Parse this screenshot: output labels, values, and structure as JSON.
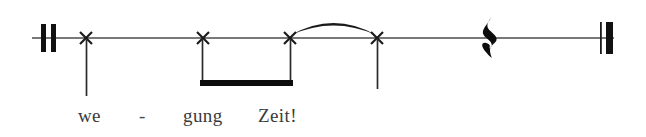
{
  "figure": {
    "width": 646,
    "height": 137,
    "background_color": "#ffffff",
    "ink_color": "#1a1a1a",
    "staff_line_color": "#4d4d4d",
    "lyric_color": "#3a3a3c"
  },
  "staff": {
    "line_y": 38,
    "line_start_x": 32,
    "line_end_x": 614,
    "line_thickness": 1.6
  },
  "barlines": [
    {
      "name": "opening-double-barline",
      "type": "thick-thick",
      "x": 40,
      "top_y": 24,
      "bottom_y": 52,
      "strokes": [
        {
          "x": 41,
          "width": 5
        },
        {
          "x": 51,
          "width": 5
        }
      ]
    },
    {
      "name": "final-barline",
      "type": "thin-thick",
      "x": 600,
      "top_y": 22,
      "bottom_y": 54,
      "strokes": [
        {
          "x": 600,
          "width": 1.6
        },
        {
          "x": 606,
          "width": 7
        }
      ]
    }
  ],
  "notes": [
    {
      "index": 1,
      "notehead": "x-notehead",
      "x": 86,
      "y": 38,
      "size": 11,
      "stem": {
        "direction": "down",
        "from_y": 40,
        "to_y": 96
      },
      "lyric": "we",
      "beamed": false,
      "slurred": false
    },
    {
      "index": 2,
      "notehead": "x-notehead",
      "x": 203,
      "y": 38,
      "size": 11,
      "stem": {
        "direction": "down",
        "from_y": 40,
        "to_y": 84
      },
      "lyric": "gung",
      "beamed": true,
      "slurred": false
    },
    {
      "index": 3,
      "notehead": "x-notehead",
      "x": 290,
      "y": 38,
      "size": 11,
      "stem": {
        "direction": "down",
        "from_y": 40,
        "to_y": 84
      },
      "lyric": "Zeit!",
      "beamed": true,
      "slurred": true
    },
    {
      "index": 4,
      "notehead": "x-notehead",
      "x": 377,
      "y": 38,
      "size": 11,
      "stem": {
        "direction": "down",
        "from_y": 40,
        "to_y": 89
      },
      "lyric": "",
      "beamed": false,
      "slurred": true
    }
  ],
  "beam": {
    "name": "eighth-beam",
    "from_x": 200,
    "to_x": 293,
    "y": 80,
    "thickness": 6
  },
  "slur": {
    "name": "slur-arc",
    "from_x": 291,
    "from_y": 35,
    "to_x": 376,
    "to_y": 35,
    "peak_y": 19
  },
  "rest": {
    "name": "quarter-rest",
    "glyph": "𝄽",
    "x": 490,
    "y": 38,
    "top_y": 17,
    "bottom_y": 58
  },
  "lyrics": {
    "baseline_y": 122,
    "font_size": 19,
    "syllables": [
      {
        "text": "we",
        "x": 78
      },
      {
        "text": "-",
        "x": 140,
        "is_hyphen": true
      },
      {
        "text": "gung",
        "x": 183
      },
      {
        "text": "Zeit!",
        "x": 258
      }
    ],
    "full_text": "we - gung Zeit!"
  }
}
